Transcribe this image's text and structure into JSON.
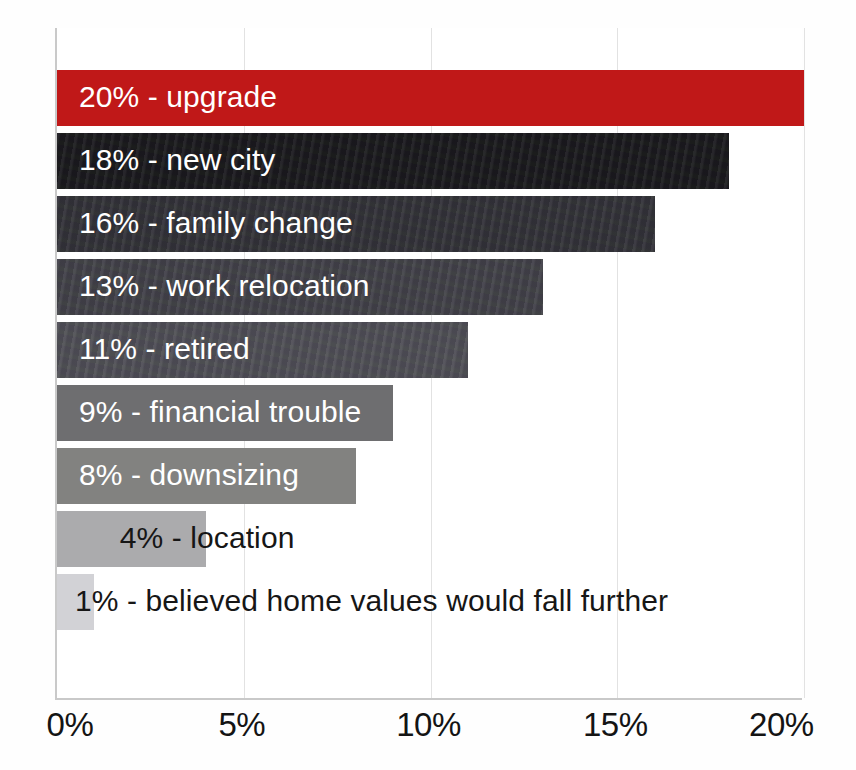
{
  "chart_data": {
    "type": "bar",
    "orientation": "horizontal",
    "title": "",
    "subtitle": "",
    "xlabel": "",
    "ylabel": "",
    "xlim": [
      0,
      20
    ],
    "grid": false,
    "legend": null,
    "xticks": [
      "0%",
      "5%",
      "10%",
      "15%",
      "20%"
    ],
    "xtick_values": [
      0,
      5,
      10,
      15,
      20
    ],
    "categories": [
      "upgrade",
      "new city",
      "family change",
      "work relocation",
      "retired",
      "financial trouble",
      "downsizing",
      "location",
      "believed home values would fall further"
    ],
    "values": [
      20,
      18,
      16,
      13,
      11,
      9,
      8,
      4,
      1
    ],
    "bars": [
      {
        "label": "20% - upgrade",
        "value": 20,
        "value_text": "20%",
        "category": "upgrade",
        "color": "#c01818",
        "label_color": "#ffffff",
        "label_placement": "inside"
      },
      {
        "label": "18% - new city",
        "value": 18,
        "value_text": "18%",
        "category": "new city",
        "color": "#151518",
        "label_color": "#ffffff",
        "label_placement": "inside"
      },
      {
        "label": "16% - family change",
        "value": 16,
        "value_text": "16%",
        "category": "family change",
        "color": "#2f2f34",
        "label_color": "#ffffff",
        "label_placement": "inside"
      },
      {
        "label": "13% - work relocation",
        "value": 13,
        "value_text": "13%",
        "category": "work relocation",
        "color": "#3f3f45",
        "label_color": "#ffffff",
        "label_placement": "inside"
      },
      {
        "label": "11% - retired",
        "value": 11,
        "value_text": "11%",
        "category": "retired",
        "color": "#4d4d53",
        "label_color": "#ffffff",
        "label_placement": "inside"
      },
      {
        "label": "9% - financial trouble",
        "value": 9,
        "value_text": "9%",
        "category": "financial trouble",
        "color": "#6e6e70",
        "label_color": "#ffffff",
        "label_placement": "inside"
      },
      {
        "label": "8% - downsizing",
        "value": 8,
        "value_text": "8%",
        "category": "downsizing",
        "color": "#828280",
        "label_color": "#ffffff",
        "label_placement": "inside"
      },
      {
        "label": "4% - location",
        "value": 4,
        "value_text": "4%",
        "category": "location",
        "color": "#ababad",
        "label_color": "#161616",
        "label_placement": "overflow"
      },
      {
        "label": "1% - believed home values would fall further",
        "value": 1,
        "value_text": "1%",
        "category": "believed home values would fall further",
        "color": "#d2d2d6",
        "label_color": "#161616",
        "label_placement": "overflow"
      }
    ]
  }
}
